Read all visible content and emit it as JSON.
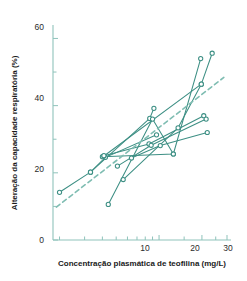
{
  "chart_data": {
    "type": "line",
    "title": "",
    "xlabel": "Concentração plasmática de teofilina (mg/L)",
    "ylabel": "Alteração da capacidade respiratória (%)",
    "xscale": "log",
    "yscale": "linear",
    "xlim": [
      1.8,
      32
    ],
    "ylim": [
      0,
      64
    ],
    "xticks": [
      2,
      3,
      4,
      5,
      6,
      7,
      8,
      9,
      10,
      15,
      20,
      25,
      30
    ],
    "xticklabels": [
      "",
      "",
      "",
      "",
      "",
      "",
      "",
      "",
      "10",
      "",
      "20",
      "",
      "30"
    ],
    "yticks": [
      0,
      10,
      20,
      30,
      40,
      50,
      60
    ],
    "yticklabels": [
      "0",
      "",
      "20",
      "",
      "40",
      "",
      "60"
    ],
    "grid": false,
    "legend": false,
    "marker": "open-circle",
    "line_color": "#3d8f84",
    "trend_color": "#7fbdb2",
    "series": [
      {
        "name": "subject-1",
        "points": [
          [
            2.0,
            14.2
          ],
          [
            3.3,
            20.2
          ],
          [
            8.6,
            36.2
          ],
          [
            9.2,
            39.2
          ]
        ]
      },
      {
        "name": "subject-2",
        "points": [
          [
            3.3,
            20.2
          ],
          [
            4.2,
            24.6
          ],
          [
            9.6,
            31.3
          ]
        ]
      },
      {
        "name": "subject-3",
        "points": [
          [
            4.0,
            24.8
          ],
          [
            12.6,
            25.6
          ],
          [
            19.6,
            54.0
          ]
        ]
      },
      {
        "name": "subject-4",
        "points": [
          [
            4.1,
            25.0
          ],
          [
            19.8,
            46.4
          ],
          [
            23.6,
            55.6
          ]
        ]
      },
      {
        "name": "subject-5",
        "points": [
          [
            4.1,
            25.1
          ],
          [
            8.5,
            28.6
          ],
          [
            20.6,
            37.0
          ]
        ]
      },
      {
        "name": "subject-6",
        "points": [
          [
            5.1,
            22.0
          ],
          [
            8.8,
            28.2
          ],
          [
            21.4,
            36.0
          ]
        ]
      },
      {
        "name": "subject-7",
        "points": [
          [
            6.4,
            24.4
          ],
          [
            10.2,
            28.1
          ],
          [
            21.8,
            32.0
          ]
        ]
      },
      {
        "name": "subject-8",
        "points": [
          [
            5.6,
            18.0
          ],
          [
            13.6,
            33.4
          ],
          [
            19.8,
            46.4
          ]
        ]
      },
      {
        "name": "subject-9",
        "points": [
          [
            4.4,
            10.6
          ],
          [
            9.0,
            36.0
          ],
          [
            12.6,
            25.6
          ]
        ]
      }
    ],
    "trend_line": {
      "name": "overall-regression",
      "style": "dashed",
      "points": [
        [
          1.9,
          9.8
        ],
        [
          28.5,
          48.4
        ]
      ]
    }
  },
  "axes": {
    "x_tick_10": "10",
    "x_tick_20": "20",
    "x_tick_30": "30",
    "y_tick_0": "0",
    "y_tick_20": "20",
    "y_tick_40": "40",
    "y_tick_60": "60"
  }
}
